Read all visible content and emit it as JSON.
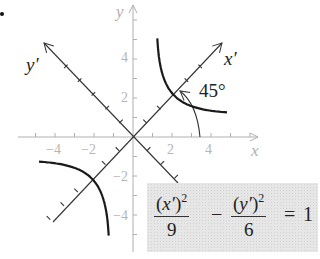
{
  "figure": {
    "bullet": "•",
    "x_axis_label": "x",
    "y_axis_label": "y",
    "rotated_x_label": "x′",
    "rotated_y_label": "y′",
    "angle_label": "45°",
    "x_ticks": [
      "−4",
      "−2",
      "2",
      "4"
    ],
    "y_ticks": [
      "4",
      "2",
      "−2",
      "−4"
    ]
  },
  "equation": {
    "term1_num_var": "x′",
    "term1_num_exp": "2",
    "term1_den": "9",
    "minus": "−",
    "term2_num_var": "y′",
    "term2_num_exp": "2",
    "term2_den": "6",
    "equals": "=",
    "rhs": "1"
  },
  "chart_data": {
    "type": "line",
    "xlabel": "x",
    "ylabel": "y",
    "xlim": [
      -5.8,
      6.5
    ],
    "ylim": [
      -5.8,
      6.8
    ],
    "rotation_deg": 45,
    "x_tick_labels": [
      -4,
      -2,
      2,
      4
    ],
    "y_tick_labels": [
      -4,
      -2,
      2,
      4
    ],
    "equation": "(x')^2/9 - (y')^2/6 = 1",
    "a": 3,
    "b_squared": 6,
    "series": [
      {
        "name": "upper-right branch",
        "vertex": [
          2.12,
          2.12
        ],
        "t_range": [
          -0.9,
          0.95
        ]
      },
      {
        "name": "lower-left branch",
        "vertex": [
          -2.12,
          -2.12
        ],
        "t_range": [
          -0.9,
          0.95
        ]
      }
    ],
    "colors": {
      "curve": "#1a1a1a",
      "rotated_axes": "#333333",
      "original_axes": "#b0b0b0",
      "equation_box": "#e6e6e6"
    }
  }
}
